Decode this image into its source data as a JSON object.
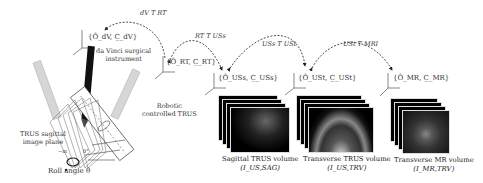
{
  "figure": {
    "instrument_label": [
      "da Vinci surgical",
      "instrument"
    ],
    "robot_label": [
      "Robotic",
      "controlled TRUS"
    ],
    "sagittal_plane_label": [
      "TRUS sagittal",
      "image plane"
    ],
    "roll_label": "Roll angle θ",
    "roll_ticks": [
      "−m",
      "0°"
    ],
    "frames": {
      "dv": "{Ô_dV, C̲_dV}",
      "rt": "{Ô_RT, C̲_RT}",
      "uss": "{Ô_USs, C̲_USs}",
      "ust": "{Ô_USt, C̲_USt}",
      "mr": "{Ô_MR, C̲_MR}"
    },
    "transforms": {
      "dv_rt": "dV T RT",
      "rt_uss": "RT T USs",
      "uss_ust": "USs T USt",
      "ust_mr": "USt T MRI"
    },
    "volumes": [
      {
        "title": "Sagittal TRUS volume",
        "symbol": "(I_US,SAG)"
      },
      {
        "title": "Transverse TRUS volume",
        "symbol": "(I_US,TRV)"
      },
      {
        "title": "Transverse MR volume",
        "symbol": "(I_MR,TRV)"
      }
    ]
  },
  "colors": {
    "line": "#333333",
    "instrument": "#111111",
    "ghost": "#cfcfcf",
    "image_bg": "#000000"
  }
}
